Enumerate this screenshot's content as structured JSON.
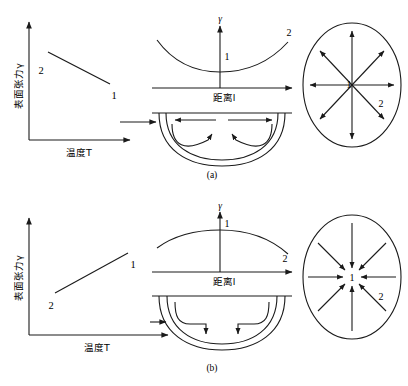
{
  "figure": {
    "background_color": "#ffffff",
    "stroke_color": "#1a1a1a",
    "panels": [
      {
        "id": "a",
        "caption": "(a)",
        "left_chart": {
          "ylabel": "表面张力γ",
          "xlabel": "温度T",
          "trend": "decreasing",
          "point_labels": {
            "upper_left": "2",
            "lower_right": "1"
          }
        },
        "middle_chart": {
          "yaxis_label": "γ",
          "xlabel": "距离l",
          "curve_shape": "concave-up",
          "curve_labels": {
            "center": "1",
            "right_end": "2"
          }
        },
        "drop_diagram": {
          "shape": "half-ellipse",
          "flow": "outward-spreading",
          "surface_arrows": "diverging",
          "interior_arrows": "rising-to-center"
        },
        "ellipse_diagram": {
          "center_label": "1",
          "edge_label": "2",
          "arrow_direction": "outward",
          "arrow_count": 8
        }
      },
      {
        "id": "b",
        "caption": "(b)",
        "left_chart": {
          "ylabel": "表面张力γ",
          "xlabel": "温度T",
          "trend": "increasing",
          "point_labels": {
            "upper_right": "1",
            "lower_left": "2"
          }
        },
        "middle_chart": {
          "yaxis_label": "γ",
          "xlabel": "距离l",
          "curve_shape": "concave-down",
          "curve_labels": {
            "center": "1",
            "right_end": "2"
          }
        },
        "drop_diagram": {
          "shape": "half-ellipse",
          "flow": "inward-contracting",
          "surface_arrows": "converging",
          "interior_arrows": "descending-to-center"
        },
        "ellipse_diagram": {
          "center_label": "1",
          "edge_label": "2",
          "arrow_direction": "inward",
          "arrow_count": 8
        }
      }
    ]
  },
  "labels": {
    "gamma": "γ",
    "one": "1",
    "two": "2",
    "temperature_axis": "温度T",
    "distance_axis": "距离l",
    "surface_tension_axis": "表面张力γ",
    "caption_a": "(a)",
    "caption_b": "(b)"
  }
}
